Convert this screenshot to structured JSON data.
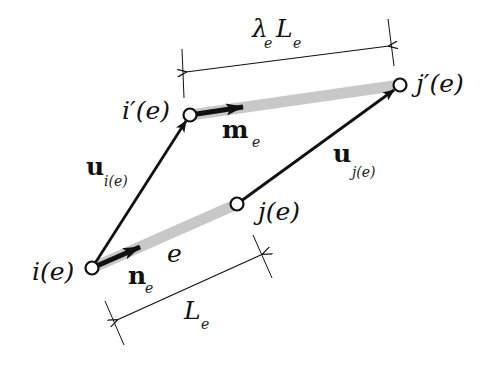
{
  "diagram": {
    "colors": {
      "bar": "#c8c8c8",
      "line": "#111111",
      "background": "#ffffff"
    },
    "nodes": {
      "i": {
        "label": "i(e)",
        "x": 92,
        "y": 268
      },
      "j": {
        "label": "j(e)",
        "x": 237,
        "y": 204
      },
      "i_prime": {
        "label": "i′(e)",
        "x": 190,
        "y": 115
      },
      "j_prime": {
        "label": "j′(e)",
        "x": 400,
        "y": 85
      }
    },
    "labels": {
      "i_node": "i(e)",
      "j_node": "j(e)",
      "i_prime_node": "i′(e)",
      "j_prime_node": "j′(e)",
      "element": "e",
      "n_vector": "n",
      "n_sub": "e",
      "m_vector": "m",
      "m_sub": "e",
      "u_i": "u",
      "u_i_sub": "i(e)",
      "u_j": "u",
      "u_j_sub": "j(e)",
      "L_main": "L",
      "L_sub": "e",
      "lambda_main": "λ",
      "lambda_sub": "e",
      "lambdaL_main": "L",
      "lambdaL_sub": "e"
    },
    "dimensions": [
      {
        "name": "undeformed-length",
        "text": "Le"
      },
      {
        "name": "deformed-length",
        "text": "λeLe"
      }
    ]
  }
}
